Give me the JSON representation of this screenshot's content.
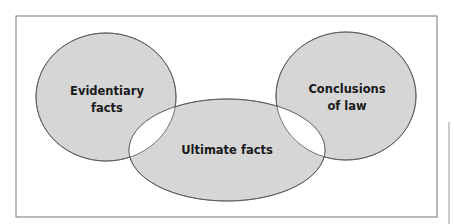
{
  "diagram": {
    "type": "venn",
    "colors": {
      "fill": "#d6d6d6",
      "stroke": "#555555",
      "overlap": "#ffffff",
      "frame": "#777777"
    },
    "sets": [
      {
        "id": "evidentiary",
        "lines": [
          "Evidentiary",
          "facts"
        ]
      },
      {
        "id": "ultimate",
        "lines": [
          "Ultimate facts"
        ]
      },
      {
        "id": "conclusions",
        "lines": [
          "Conclusions",
          "of law"
        ]
      }
    ],
    "overlaps": [
      "Evidentiary facts ∩ Ultimate facts",
      "Ultimate facts ∩ Conclusions of law"
    ]
  }
}
